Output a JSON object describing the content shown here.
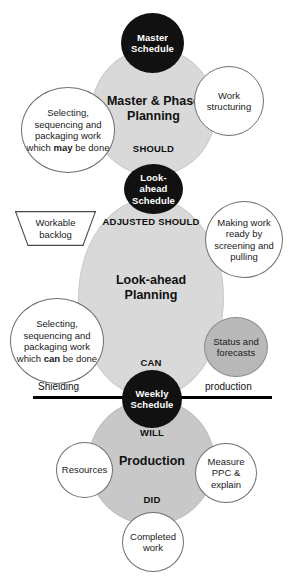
{
  "diagram": {
    "colors": {
      "node_fill": "#111111",
      "node_text": "#ffffff",
      "process_fill": "#d9d9d9",
      "process_fill_dark": "#c8c8c8",
      "bubble_fill": "#ffffff",
      "bubble_gray_fill": "#b8b8b8",
      "divider": "#000000",
      "text": "#111111"
    }
  },
  "nodes": {
    "master_schedule": "Master Schedule",
    "look_ahead_schedule": "Look-ahead Schedule",
    "weekly_schedule": "Weekly Schedule"
  },
  "stages": [
    {
      "id": "master-phase-planning",
      "title": "Master & Phase Planning",
      "label": "SHOULD"
    },
    {
      "id": "look-ahead-planning",
      "title": "Look-ahead Planning",
      "label": "CAN",
      "label_top": "ADJUSTED SHOULD"
    },
    {
      "id": "production",
      "title": "Production",
      "label_top": "WILL",
      "label_bottom": "DID"
    }
  ],
  "bubbles": {
    "selecting_may": "Selecting, sequencing and packaging work which",
    "selecting_may_bold": "may",
    "selecting_may_tail": "be done",
    "work_structuring": "Work structuring",
    "making_work_ready": "Making work ready by screening and pulling",
    "selecting_can": "Selecting, sequencing and packaging work which",
    "selecting_can_bold": "can",
    "selecting_can_tail": "be done",
    "status_and_forecasts": "Status and forecasts",
    "workable_backlog": "Workable backlog",
    "resources": "Resources",
    "measure_ppc": "Measure PPC & explain",
    "completed_work": "Completed work"
  },
  "divider": {
    "left_label": "Shielding",
    "right_label": "production"
  }
}
